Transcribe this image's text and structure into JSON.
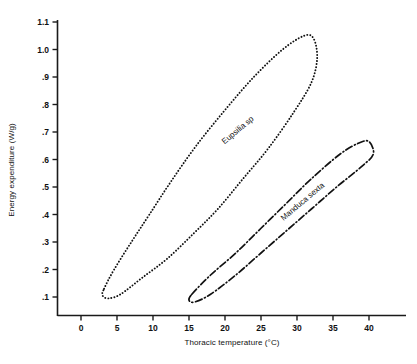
{
  "chart_data": {
    "type": "scatter",
    "title": "",
    "xlabel": "Thoracic temperature (°C)",
    "ylabel": "Energy expenditure (W/g)",
    "xlim": [
      0,
      40
    ],
    "ylim": [
      0.1,
      1.1
    ],
    "xticks": [
      "0",
      "5",
      "10",
      "15",
      "20",
      "25",
      "30",
      "35",
      "40"
    ],
    "xtick_values": [
      0,
      5,
      10,
      15,
      20,
      25,
      30,
      35,
      40
    ],
    "yticks": [
      "1.1",
      "1.0",
      ".9",
      ".8",
      ".7",
      ".6",
      ".5",
      ".4",
      ".3",
      ".2",
      ".1"
    ],
    "ytick_values": [
      1.1,
      1.0,
      0.9,
      0.8,
      0.7,
      0.6,
      0.5,
      0.4,
      0.3,
      0.2,
      0.1
    ],
    "grid": false,
    "legend_position": "inline-annotation",
    "series": [
      {
        "name": "Eupsilia sp",
        "style": "dotted-envelope",
        "x_range": [
          3.0,
          32.5
        ],
        "y_range": [
          0.1,
          1.05
        ],
        "envelope": [
          [
            3.2,
            0.13
          ],
          [
            4.6,
            0.2
          ],
          [
            7.0,
            0.3
          ],
          [
            9.5,
            0.4
          ],
          [
            12.5,
            0.52
          ],
          [
            16.0,
            0.65
          ],
          [
            20.0,
            0.78
          ],
          [
            24.0,
            0.9
          ],
          [
            28.0,
            1.0
          ],
          [
            31.0,
            1.05
          ],
          [
            32.3,
            1.04
          ],
          [
            32.8,
            0.97
          ],
          [
            32.0,
            0.88
          ],
          [
            29.5,
            0.77
          ],
          [
            26.0,
            0.64
          ],
          [
            22.5,
            0.53
          ],
          [
            19.0,
            0.42
          ],
          [
            15.6,
            0.33
          ],
          [
            12.0,
            0.24
          ],
          [
            8.5,
            0.17
          ],
          [
            5.5,
            0.11
          ],
          [
            3.8,
            0.095
          ],
          [
            3.0,
            0.105
          ]
        ],
        "label_x": 22.0,
        "label_y": 0.7
      },
      {
        "name": "Manduca sexta",
        "style": "dash-dot-envelope",
        "x_range": [
          15.0,
          40.5
        ],
        "y_range": [
          0.08,
          0.66
        ],
        "envelope": [
          [
            15.4,
            0.11
          ],
          [
            18.0,
            0.18
          ],
          [
            21.5,
            0.26
          ],
          [
            25.0,
            0.35
          ],
          [
            28.5,
            0.44
          ],
          [
            32.0,
            0.53
          ],
          [
            36.0,
            0.62
          ],
          [
            38.6,
            0.66
          ],
          [
            40.0,
            0.665
          ],
          [
            40.6,
            0.62
          ],
          [
            39.0,
            0.575
          ],
          [
            35.5,
            0.5
          ],
          [
            32.0,
            0.42
          ],
          [
            28.5,
            0.34
          ],
          [
            25.0,
            0.26
          ],
          [
            21.5,
            0.18
          ],
          [
            18.0,
            0.11
          ],
          [
            15.8,
            0.082
          ],
          [
            15.0,
            0.088
          ]
        ],
        "label_x": 31.0,
        "label_y": 0.44
      }
    ]
  },
  "axes": {
    "x_axis_name": "Thoracic temperature (°C)",
    "y_axis_name": "Energy expenditure (W/g)"
  },
  "colors": {
    "axis": "#1a1a1a",
    "series_eupsilia": "#111111",
    "series_manduca": "#111111",
    "background": "#ffffff"
  }
}
